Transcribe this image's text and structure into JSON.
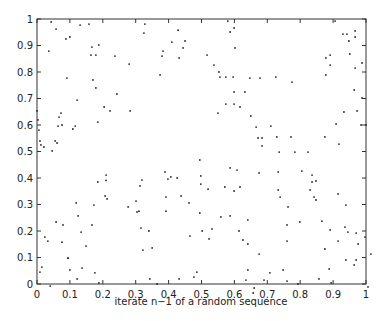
{
  "chart_data": {
    "type": "scatter",
    "title": "",
    "xlabel": "iterate n−1 of a random sequence",
    "ylabel": "",
    "xlim": [
      0,
      1
    ],
    "ylim": [
      0,
      1
    ],
    "grid": false,
    "legend": null,
    "xticks": [
      "0",
      "0.1",
      "0.2",
      "0.3",
      "0.4",
      "0.5",
      "0.6",
      "0.7",
      "0.8",
      "0.9",
      "1"
    ],
    "yticks": [
      "0",
      "0.1",
      "0.2",
      "0.3",
      "0.4",
      "0.5",
      "0.6",
      "0.7",
      "0.8",
      "0.9",
      "1"
    ],
    "marker": "dot",
    "color": "#222222",
    "points": [
      [
        0.043,
        0.989
      ],
      [
        0.058,
        0.962
      ],
      [
        0.036,
        0.879
      ],
      [
        0.088,
        0.925
      ],
      [
        0.1,
        0.932
      ],
      [
        0.091,
        0.777
      ],
      [
        0.122,
        0.694
      ],
      [
        0.131,
        0.977
      ],
      [
        0.158,
        0.981
      ],
      [
        0.164,
        0.864
      ],
      [
        0.179,
        0.864
      ],
      [
        0.167,
        0.894
      ],
      [
        0.188,
        0.902
      ],
      [
        0.17,
        0.77
      ],
      [
        0.179,
        0.74
      ],
      [
        0.185,
        0.611
      ],
      [
        0.204,
        0.668
      ],
      [
        0.237,
        0.86
      ],
      [
        0.243,
        0.717
      ],
      [
        0.222,
        0.653
      ],
      [
        0.28,
        0.83
      ],
      [
        0.283,
        0.653
      ],
      [
        0.328,
        0.981
      ],
      [
        0.325,
        0.947
      ],
      [
        0.383,
        0.879
      ],
      [
        0.38,
        0.86
      ],
      [
        0.432,
        0.853
      ],
      [
        0.374,
        0.789
      ],
      [
        0.429,
        0.958
      ],
      [
        0.444,
        0.891
      ],
      [
        0.41,
        0.913
      ],
      [
        0.45,
        0.917
      ],
      [
        0.0,
        0.653
      ],
      [
        0.003,
        0.619
      ],
      [
        0.006,
        0.581
      ],
      [
        0.009,
        0.54
      ],
      [
        0.012,
        0.525
      ],
      [
        0.021,
        0.517
      ],
      [
        0.046,
        0.502
      ],
      [
        0.067,
        0.63
      ],
      [
        0.076,
        0.6
      ],
      [
        0.073,
        0.645
      ],
      [
        0.055,
        0.54
      ],
      [
        0.061,
        0.532
      ],
      [
        0.064,
        0.596
      ],
      [
        0.109,
        0.585
      ],
      [
        0.116,
        0.596
      ],
      [
        0.58,
        0.992
      ],
      [
        0.587,
        0.951
      ],
      [
        0.599,
        0.966
      ],
      [
        0.602,
        0.891
      ],
      [
        0.517,
        0.864
      ],
      [
        0.538,
        0.826
      ],
      [
        0.556,
        0.781
      ],
      [
        0.553,
        0.8
      ],
      [
        0.574,
        0.781
      ],
      [
        0.596,
        0.781
      ],
      [
        0.647,
        0.777
      ],
      [
        0.678,
        0.777
      ],
      [
        0.726,
        0.781
      ],
      [
        0.775,
        0.762
      ],
      [
        0.599,
        0.725
      ],
      [
        0.632,
        0.725
      ],
      [
        0.574,
        0.679
      ],
      [
        0.599,
        0.679
      ],
      [
        0.617,
        0.668
      ],
      [
        0.55,
        0.645
      ],
      [
        0.65,
        0.634
      ],
      [
        0.666,
        0.592
      ],
      [
        0.711,
        0.596
      ],
      [
        0.672,
        0.551
      ],
      [
        0.684,
        0.551
      ],
      [
        0.729,
        0.555
      ],
      [
        0.772,
        0.555
      ],
      [
        0.736,
        0.498
      ],
      [
        0.684,
        0.521
      ],
      [
        0.784,
        0.498
      ],
      [
        0.824,
        0.498
      ],
      [
        0.875,
        0.555
      ],
      [
        0.891,
        0.826
      ],
      [
        0.878,
        0.789
      ],
      [
        0.878,
        0.853
      ],
      [
        0.891,
        0.864
      ],
      [
        0.906,
        0.992
      ],
      [
        0.93,
        0.943
      ],
      [
        0.942,
        0.943
      ],
      [
        0.951,
        0.868
      ],
      [
        0.948,
        0.917
      ],
      [
        0.967,
        0.955
      ],
      [
        0.967,
        0.932
      ],
      [
        0.967,
        0.815
      ],
      [
        0.964,
        0.732
      ],
      [
        0.988,
        0.834
      ],
      [
        0.973,
        0.653
      ],
      [
        0.988,
        0.702
      ],
      [
        0.985,
        0.6
      ],
      [
        0.909,
        0.604
      ],
      [
        0.918,
        0.528
      ],
      [
        0.933,
        0.649
      ],
      [
        1.0,
        0.6
      ],
      [
        0.024,
        0.177
      ],
      [
        0.033,
        0.162
      ],
      [
        0.079,
        0.223
      ],
      [
        0.058,
        0.234
      ],
      [
        0.009,
        0.045
      ],
      [
        0.015,
        0.064
      ],
      [
        0.04,
        -0.008
      ],
      [
        0.076,
        0.158
      ],
      [
        0.094,
        0.098
      ],
      [
        0.1,
        0.053
      ],
      [
        0.119,
        0.306
      ],
      [
        0.125,
        0.257
      ],
      [
        0.094,
        0.098
      ],
      [
        0.122,
        0.019
      ],
      [
        0.137,
        0.06
      ],
      [
        0.149,
        0.143
      ],
      [
        0.134,
        0.196
      ],
      [
        0.167,
        0.223
      ],
      [
        0.173,
        0.298
      ],
      [
        0.185,
        0.385
      ],
      [
        0.21,
        0.411
      ],
      [
        0.207,
        0.332
      ],
      [
        0.213,
        0.321
      ],
      [
        0.21,
        0.391
      ],
      [
        0.176,
        0.042
      ],
      [
        0.188,
        0.004
      ],
      [
        0.277,
        0.291
      ],
      [
        0.304,
        0.272
      ],
      [
        0.31,
        0.275
      ],
      [
        0.313,
        0.37
      ],
      [
        0.319,
        0.392
      ],
      [
        0.301,
        0.313
      ],
      [
        0.316,
        0.211
      ],
      [
        0.34,
        0.2
      ],
      [
        0.322,
        0.128
      ],
      [
        0.35,
        0.136
      ],
      [
        0.343,
        0.019
      ],
      [
        0.365,
        0.0
      ],
      [
        0.389,
        0.423
      ],
      [
        0.392,
        0.328
      ],
      [
        0.392,
        0.275
      ],
      [
        0.398,
        0.396
      ],
      [
        0.407,
        0.404
      ],
      [
        0.426,
        0.4
      ],
      [
        0.438,
        0.332
      ],
      [
        0.462,
        0.306
      ],
      [
        0.465,
        0.181
      ],
      [
        0.432,
        0.019
      ],
      [
        0.477,
        0.026
      ],
      [
        0.486,
        0.045
      ],
      [
        0.495,
        0.268
      ],
      [
        0.523,
        0.17
      ],
      [
        0.532,
        0.208
      ],
      [
        0.502,
        0.2
      ],
      [
        0.495,
        0.468
      ],
      [
        0.498,
        0.377
      ],
      [
        0.498,
        0.408
      ],
      [
        0.52,
        0.358
      ],
      [
        0.559,
        0.253
      ],
      [
        0.571,
        0.366
      ],
      [
        0.617,
        0.366
      ],
      [
        0.587,
        0.257
      ],
      [
        0.599,
        0.351
      ],
      [
        0.641,
        0.242
      ],
      [
        0.587,
        0.438
      ],
      [
        0.608,
        0.43
      ],
      [
        0.614,
        0.2
      ],
      [
        0.626,
        0.166
      ],
      [
        0.641,
        0.151
      ],
      [
        0.675,
        0.113
      ],
      [
        0.657,
        -0.034
      ],
      [
        0.675,
        0.419
      ],
      [
        0.641,
        0.053
      ],
      [
        0.635,
        0.015
      ],
      [
        0.733,
        0.423
      ],
      [
        0.733,
        0.355
      ],
      [
        0.739,
        0.328
      ],
      [
        0.763,
        0.291
      ],
      [
        0.76,
        0.223
      ],
      [
        0.76,
        0.162
      ],
      [
        0.799,
        0.234
      ],
      [
        0.76,
        0.011
      ],
      [
        0.66,
        -0.015
      ],
      [
        0.69,
        0.015
      ],
      [
        0.891,
        0.204
      ],
      [
        0.915,
        0.162
      ],
      [
        0.945,
        0.196
      ],
      [
        0.939,
        0.091
      ],
      [
        0.976,
        0.151
      ],
      [
        0.964,
        0.072
      ],
      [
        0.997,
        0.177
      ],
      [
        0.97,
        0.091
      ],
      [
        0.805,
        0.426
      ],
      [
        0.842,
        0.328
      ],
      [
        0.848,
        0.389
      ],
      [
        0.748,
        0.053
      ],
      [
        0.708,
        0.042
      ],
      [
        0.857,
        0.019
      ],
      [
        0.848,
        0.317
      ],
      [
        0.875,
        0.132
      ],
      [
        0.888,
        0.057
      ],
      [
        0.83,
        0.355
      ],
      [
        0.915,
        0.34
      ],
      [
        0.936,
        0.215
      ],
      [
        0.97,
        0.192
      ],
      [
        1.015,
        0.113
      ],
      [
        1.006,
        -0.011
      ],
      [
        0.894,
        0.004
      ],
      [
        0.793,
        0.0
      ],
      [
        0.836,
        0.411
      ],
      [
        0.866,
        0.237
      ],
      [
        0.939,
        0.298
      ],
      [
        0.836,
        0.385
      ]
    ]
  }
}
